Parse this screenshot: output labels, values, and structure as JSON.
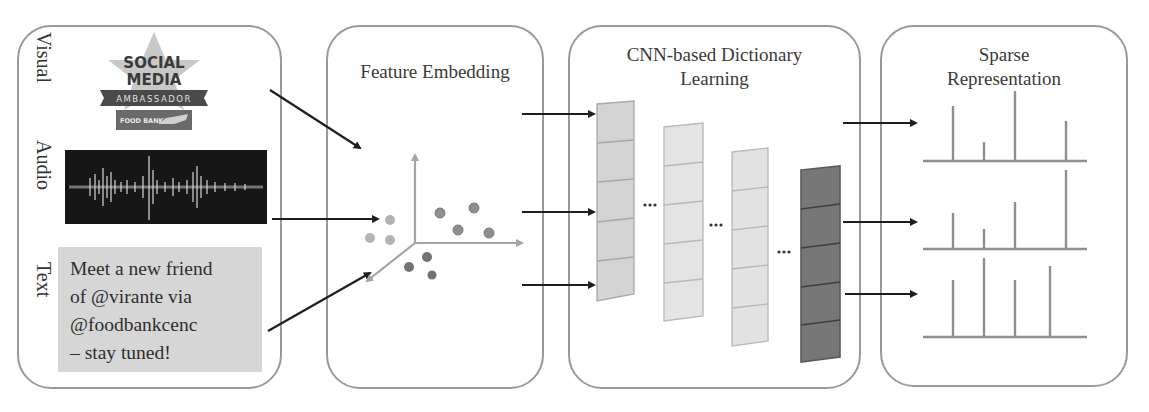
{
  "panels": {
    "input": {
      "labels": [
        "Visual",
        "Audio",
        "Text"
      ],
      "badge": {
        "line1": "SOCIAL",
        "line2": "MEDIA",
        "ribbon": "AMBASSADOR",
        "footer": "FOOD BANK"
      },
      "tweet_lines": [
        "Meet a new friend",
        "of @virante via",
        "@foodbankcenc",
        "– stay tuned!"
      ]
    },
    "embedding": {
      "title": "Feature Embedding"
    },
    "dictionary": {
      "title_line1": "CNN-based Dictionary",
      "title_line2": "Learning",
      "ellipsis": "···"
    },
    "sparse": {
      "title_line1": "Sparse",
      "title_line2": "Representation"
    }
  },
  "colors": {
    "border": "#9a9a9a",
    "arrow": "#1e1e1e",
    "axis": "#a4a4a4",
    "dot_light": "#b3b3b3",
    "dot_mid": "#8c8c8c",
    "dot_dark": "#6e6e6e",
    "column_light1": "#d4d4d4",
    "column_light2": "#e4e4e4",
    "column_light3": "#e2e2e2",
    "column_dark": "#767676",
    "spike": "#8f8f8f"
  },
  "embedding_points": {
    "light": [
      [
        390,
        220
      ],
      [
        370,
        238
      ],
      [
        390,
        240
      ]
    ],
    "mid": [
      [
        440,
        213
      ],
      [
        474,
        208
      ],
      [
        458,
        230
      ],
      [
        489,
        233
      ]
    ],
    "dark": [
      [
        427,
        257
      ],
      [
        409,
        267
      ],
      [
        432,
        275
      ]
    ]
  },
  "sparse_charts": [
    {
      "baseline_y": 161,
      "spikes": [
        [
          953,
          106
        ],
        [
          984,
          142
        ],
        [
          1015,
          91
        ],
        [
          1066,
          121
        ]
      ]
    },
    {
      "baseline_y": 249,
      "spikes": [
        [
          953,
          213
        ],
        [
          984,
          229
        ],
        [
          1015,
          202
        ],
        [
          1066,
          170
        ]
      ]
    },
    {
      "baseline_y": 337,
      "spikes": [
        [
          953,
          280
        ],
        [
          984,
          258
        ],
        [
          1015,
          280
        ],
        [
          1050,
          266
        ]
      ]
    }
  ]
}
